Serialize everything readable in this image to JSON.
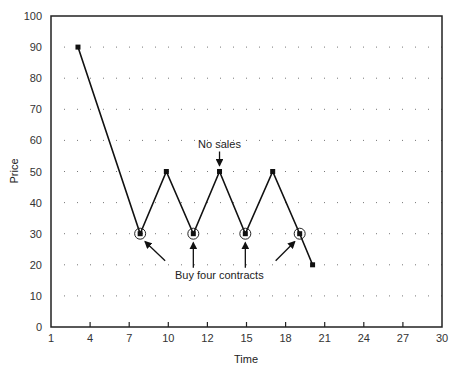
{
  "chart_data": {
    "type": "line",
    "title": "",
    "xlabel": "Time",
    "ylabel": "Price",
    "ylim": [
      0,
      100
    ],
    "x_tick_labels": [
      "1",
      "4",
      "7",
      "10",
      "12",
      "15",
      "18",
      "21",
      "24",
      "27",
      "30"
    ],
    "y_tick_labels": [
      "0",
      "10",
      "20",
      "30",
      "40",
      "50",
      "60",
      "70",
      "80",
      "90",
      "100"
    ],
    "grid": "dotted",
    "legend": null,
    "series": [
      {
        "name": "Price",
        "x_tick_index": [
          0.69,
          2.28,
          2.95,
          3.64,
          4.31,
          4.97,
          5.67,
          6.36,
          6.69
        ],
        "x_approx": [
          3,
          8,
          10,
          11.5,
          13.5,
          15,
          17,
          19,
          20
        ],
        "values": [
          90,
          30,
          50,
          30,
          50,
          30,
          50,
          30,
          20
        ]
      }
    ],
    "circled_points": [
      1,
      3,
      5,
      7
    ],
    "annotations": [
      {
        "text": "No sales",
        "target_point": 4
      },
      {
        "text": "Buy four contracts",
        "target_points": [
          1,
          3,
          5,
          7
        ]
      }
    ]
  }
}
